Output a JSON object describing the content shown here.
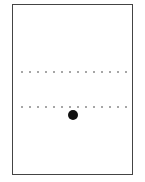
{
  "diagram": {
    "frame": {
      "stroke": "#444444"
    },
    "dotted_lines": [
      {
        "y": 72,
        "dot_count": 14
      },
      {
        "y": 107,
        "dot_count": 14
      }
    ],
    "marker": {
      "x": 73,
      "y": 115,
      "color": "#111111"
    }
  }
}
